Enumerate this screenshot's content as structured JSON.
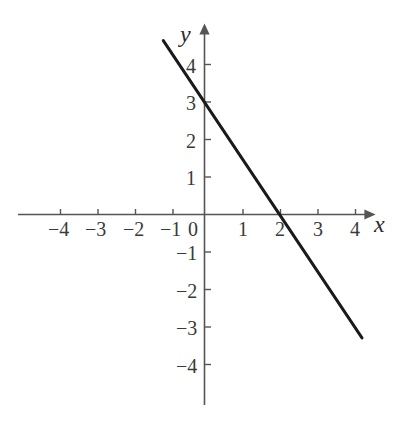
{
  "chart_data": {
    "type": "line",
    "title": "",
    "subtitle": "",
    "xlabel": "x",
    "ylabel": "y",
    "xlim": [
      -5,
      4.5
    ],
    "ylim": [
      -5,
      5
    ],
    "grid": false,
    "legend": null,
    "axis_style": "cartesian-arrows",
    "x_ticks": [
      -4,
      -3,
      -2,
      -1,
      0,
      1,
      2,
      3,
      4
    ],
    "x_tick_labels": [
      "−4",
      "−3",
      "−2",
      "−1",
      "0",
      "1",
      "2",
      "3",
      "4"
    ],
    "y_ticks": [
      -4,
      -3,
      -2,
      -1,
      1,
      2,
      3,
      4
    ],
    "y_tick_labels": [
      "−4",
      "−3",
      "−2",
      "−1",
      "1",
      "2",
      "3",
      "4"
    ],
    "series": [
      {
        "name": "line",
        "equation": "y = -1.5x + 3",
        "slope": -1.5,
        "intercept": 3,
        "x_intercept": 2,
        "y_intercept": 3,
        "color": "#1a1a1a",
        "linewidth": 3,
        "x": [
          -1.1,
          4.2
        ],
        "y": [
          4.65,
          -3.3
        ],
        "points": [
          {
            "x": -1.1,
            "y": 4.65
          },
          {
            "x": 0,
            "y": 3
          },
          {
            "x": 2,
            "y": 0
          },
          {
            "x": 4.2,
            "y": -3.3
          }
        ]
      }
    ],
    "colors": {
      "line": "#1a1a1a",
      "axis": "#555555",
      "tick_text": "#3a3a3a",
      "background": "#ffffff"
    }
  },
  "axes": {
    "x_axis_label": "x",
    "y_axis_label": "y",
    "origin_label": "0"
  },
  "ticks": {
    "x_negative": [
      "−4",
      "−3",
      "−2",
      "−1"
    ],
    "x_origin": "0",
    "x_positive": [
      "1",
      "2",
      "3",
      "4"
    ],
    "y_positive": [
      "4",
      "3",
      "2",
      "1"
    ],
    "y_negative": [
      "−1",
      "−2",
      "−3",
      "−4"
    ]
  },
  "tick_items": {
    "xm4": "−4",
    "xm3": "−3",
    "xm2": "−2",
    "xm1": "−1",
    "x0": "0",
    "xp1": "1",
    "xp2": "2",
    "xp3": "3",
    "xp4": "4",
    "yp4": "4",
    "yp3": "3",
    "yp2": "2",
    "yp1": "1",
    "ym1": "−1",
    "ym2": "−2",
    "ym3": "−3",
    "ym4": "−4"
  }
}
